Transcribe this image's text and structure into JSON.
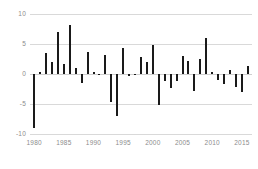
{
  "chart_data": {
    "type": "bar",
    "title": "",
    "subtitle": "",
    "xlabel": "",
    "ylabel": "",
    "xlim": [
      1979.3,
      2016.7
    ],
    "ylim": [
      -10,
      10
    ],
    "grid": true,
    "legend": null,
    "y_ticks": [
      10,
      5,
      0,
      -5,
      -10
    ],
    "y_tick_labels": [
      "10",
      "5",
      "0",
      "-5",
      "-10"
    ],
    "x_ticks": [
      1980,
      1985,
      1990,
      1995,
      2000,
      2005,
      2010,
      2015
    ],
    "x_tick_labels": [
      "1980",
      "1985",
      "1990",
      "1995",
      "2000",
      "2005",
      "2010",
      "2015"
    ],
    "bar_color": "#1a1a1a",
    "grid_color": "#d9d9d9",
    "axis_label_color": "#8c8c8c",
    "categories": [
      1980,
      1981,
      1982,
      1983,
      1984,
      1985,
      1986,
      1987,
      1988,
      1989,
      1990,
      1991,
      1992,
      1993,
      1994,
      1995,
      1996,
      1997,
      1998,
      1999,
      2000,
      2001,
      2002,
      2003,
      2004,
      2005,
      2006,
      2007,
      2008,
      2009,
      2010,
      2011,
      2012,
      2013,
      2014,
      2015,
      2016
    ],
    "values": [
      -9.0,
      0.4,
      3.5,
      2.0,
      7.0,
      1.6,
      8.2,
      1.0,
      -1.5,
      3.6,
      0.3,
      -0.2,
      3.2,
      -4.7,
      -7.0,
      4.3,
      -0.4,
      -0.2,
      2.9,
      2.0,
      4.9,
      -5.2,
      -1.2,
      -2.4,
      -1.2,
      3.0,
      2.2,
      -2.9,
      2.5,
      6.0,
      0.3,
      -1.0,
      -1.7,
      0.7,
      -2.2,
      -3.0,
      1.3
    ]
  }
}
